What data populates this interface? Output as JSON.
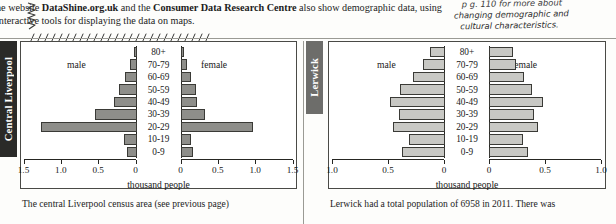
{
  "header": {
    "paragraph_html": "he website <b>DataShine.org.uk</b> and the <b>Consumer Data Research Centre</b> also show demographic data, using interactive tools for displaying the data on maps."
  },
  "margin_note": {
    "line1": "p g. 110 for more about",
    "line2": "changing demographic and",
    "line3": "cultural characteristics."
  },
  "panels": [
    {
      "tab_label": "Central Liverpool",
      "caption": "The central Liverpool census area (see previous page)",
      "male_label": "male",
      "female_label": "female",
      "axis_title": "thousand people"
    },
    {
      "tab_label": "Lerwick",
      "caption": "Lerwick had a total population of 6958 in 2011. There was",
      "male_label": "male",
      "female_label": "female",
      "axis_title": "thousand people"
    }
  ],
  "chart_data": [
    {
      "type": "bar",
      "title": "Central Liverpool population pyramid",
      "subtitle": "The central Liverpool census area (see previous page)",
      "xlabel": "thousand people",
      "ylabel": "",
      "orientation": "horizontal-diverging",
      "categories": [
        "80+",
        "70-79",
        "60-69",
        "50-59",
        "40-49",
        "30-39",
        "20-29",
        "10-19",
        "0-9"
      ],
      "tick_labels_left": [
        "1.5",
        "1.0",
        "0.5",
        "0"
      ],
      "tick_labels_right": [
        "0",
        "0.5",
        "1.0",
        "1.5"
      ],
      "xlim": [
        0,
        1.5
      ],
      "grid": false,
      "legend": [
        "male",
        "female"
      ],
      "legend_position": "inside-top",
      "series": [
        {
          "name": "male",
          "values": [
            0.04,
            0.09,
            0.16,
            0.23,
            0.3,
            0.55,
            1.28,
            0.17,
            0.13
          ]
        },
        {
          "name": "female",
          "values": [
            0.05,
            0.09,
            0.14,
            0.21,
            0.22,
            0.33,
            0.97,
            0.14,
            0.17
          ]
        }
      ]
    },
    {
      "type": "bar",
      "title": "Lerwick population pyramid",
      "subtitle": "Lerwick had a total population of 6958 in 2011. There was",
      "xlabel": "thousand people",
      "ylabel": "",
      "orientation": "horizontal-diverging",
      "categories": [
        "80+",
        "70-79",
        "60-69",
        "50-59",
        "40-49",
        "30-39",
        "20-29",
        "10-19",
        "0-9"
      ],
      "tick_labels_left": [
        "1.0",
        "0.5",
        "0"
      ],
      "tick_labels_right": [
        "0",
        "0.5",
        "1.0"
      ],
      "xlim": [
        0,
        1.0
      ],
      "grid": false,
      "legend": [
        "male",
        "female"
      ],
      "legend_position": "inside-top",
      "series": [
        {
          "name": "male",
          "values": [
            0.13,
            0.2,
            0.29,
            0.4,
            0.49,
            0.41,
            0.46,
            0.32,
            0.38
          ]
        },
        {
          "name": "female",
          "values": [
            0.21,
            0.24,
            0.31,
            0.38,
            0.48,
            0.4,
            0.44,
            0.3,
            0.35
          ]
        }
      ]
    }
  ],
  "colors": {
    "bar_dark": "#8e8e8a",
    "bar_light": "#c8c8c4",
    "tab_dark": "#2a2a28",
    "tab_grey": "#6d6d6a",
    "rule": "#9a9a94"
  }
}
